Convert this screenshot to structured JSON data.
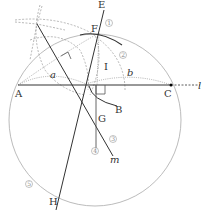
{
  "figure": {
    "points": {
      "A": "A",
      "B": "B",
      "C": "C",
      "E": "E",
      "F": "F",
      "G": "G",
      "H": "H",
      "I": "I"
    },
    "lines": {
      "l": "l",
      "m": "m"
    },
    "arcs": {
      "a": "a",
      "b": "b"
    },
    "step_markers": [
      "1",
      "2",
      "3",
      "4",
      "5"
    ],
    "colors": {
      "main_line": "#333333",
      "circle": "#aaaaaa",
      "construction": "#999999"
    }
  }
}
